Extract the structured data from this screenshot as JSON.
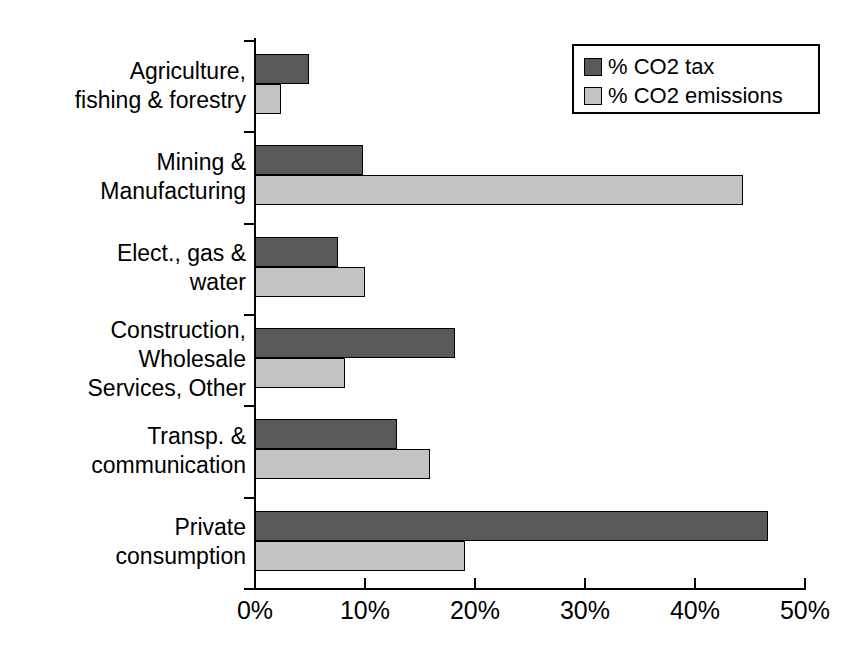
{
  "chart_data": {
    "type": "bar",
    "orientation": "horizontal",
    "title": "",
    "subtitle": "",
    "xlabel": "",
    "ylabel": "",
    "xlim": [
      0,
      50
    ],
    "xtick_labels": [
      "0%",
      "10%",
      "20%",
      "30%",
      "40%",
      "50%"
    ],
    "xtick_values": [
      0,
      10,
      20,
      30,
      40,
      50
    ],
    "grid": false,
    "legend_position": "top-right",
    "categories": [
      "Agriculture,\nfishing & forestry",
      "Mining &\nManufacturing",
      "Elect., gas &\nwater",
      "Construction,\nWholesale\nServices, Other",
      "Transp. &\ncommunication",
      "Private\nconsumption"
    ],
    "series": [
      {
        "name": "% CO2 tax",
        "color": "#595959",
        "values": [
          4.9,
          9.8,
          7.5,
          18.2,
          12.9,
          46.6
        ]
      },
      {
        "name": "% CO2 emissions",
        "color": "#c3c3c3",
        "values": [
          2.4,
          44.4,
          10.0,
          8.2,
          15.9,
          19.1
        ]
      }
    ]
  },
  "legend": {
    "entries": [
      {
        "label": "% CO2 tax"
      },
      {
        "label": "% CO2 emissions"
      }
    ]
  }
}
